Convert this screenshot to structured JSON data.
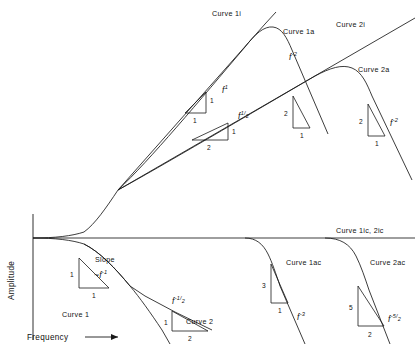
{
  "figure": {
    "axes": {
      "y_label": "Amplitude",
      "x_label": "Frequency",
      "x_arrow": "→"
    },
    "curve_labels": {
      "curve_1i": "Curve 1i",
      "curve_1a": "Curve 1a",
      "curve_2i": "Curve 2i",
      "curve_2a": "Curve 2a",
      "curve_1ic_2ic": "Curve 1ic, 2ic",
      "curve_1ac": "Curve 1ac",
      "curve_2ac": "Curve 2ac",
      "curve_1": "Curve 1",
      "curve_2": "Curve 2"
    },
    "slope_label": "Slope",
    "power_labels": {
      "f1": "f",
      "f1_exp": "1",
      "f_half_base": "f",
      "f_half_num": "1",
      "f_half_den": "2",
      "f_minus2_left_base": "f",
      "f_minus2_left_exp": "-2",
      "f_minus2_right_base": "f",
      "f_minus2_right_exp": "-2",
      "f_minus1_base": "~f",
      "f_minus1_exp": "-1",
      "f_minus_half_base": "f",
      "f_minus_half_num": "-1",
      "f_minus_half_den": "2",
      "f_minus3_base": "f",
      "f_minus3_exp": "-3",
      "f_minus5_2_base": "f",
      "f_minus5_2_num": "-5",
      "f_minus5_2_den": "2"
    },
    "slope_triangles": {
      "t_f1_rise": "1",
      "t_f1_run": "1",
      "t_fhalf_rise": "1",
      "t_fhalf_run": "2",
      "t_fm2_left_rise": "2",
      "t_fm2_left_run": "1",
      "t_fm2_right_rise": "2",
      "t_fm2_right_run": "1",
      "t_fm1_rise": "1",
      "t_fm1_run": "1",
      "t_fmhalf_rise": "1",
      "t_fmhalf_run": "2",
      "t_fm3_rise": "3",
      "t_fm3_run": "1",
      "t_fm52_rise": "5",
      "t_fm52_run": "2"
    },
    "colors": {
      "ink": "#1a1a1a",
      "background": "#ffffff"
    }
  }
}
